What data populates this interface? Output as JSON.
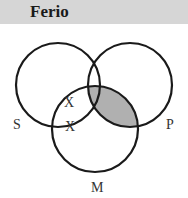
{
  "header": {
    "title": "Ferio"
  },
  "diagram": {
    "type": "venn-3",
    "circles": [
      {
        "label": "S",
        "cx": 58,
        "cy": 85,
        "r": 42
      },
      {
        "label": "P",
        "cx": 130,
        "cy": 85,
        "r": 42
      },
      {
        "label": "M",
        "cx": 95,
        "cy": 129,
        "r": 43
      }
    ],
    "marks": [
      {
        "text": "X",
        "region": "S∩M not P"
      },
      {
        "text": "X",
        "region": "S∩M boundary of P"
      }
    ],
    "shaded_region": "M∩P (not S-only shading)",
    "shade_color": "#b0b0b0",
    "line_color": "#1a1a1a"
  }
}
